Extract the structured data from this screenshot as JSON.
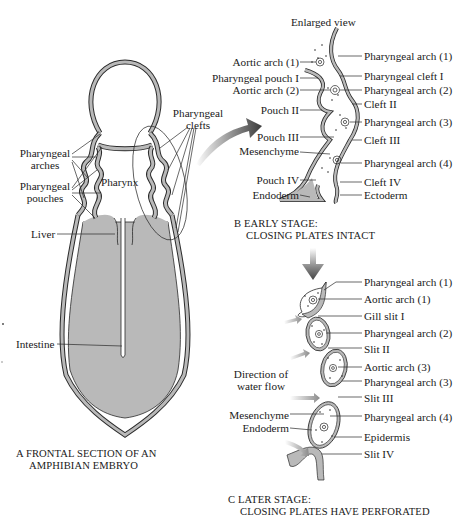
{
  "panel_a": {
    "labels": {
      "pharyngeal_arches": "Pharyngeal\narches",
      "pharyngeal_arches_l1": "Pharyngeal",
      "pharyngeal_arches_l2": "arches",
      "pharyngeal_pouches_l1": "Pharyngeal",
      "pharyngeal_pouches_l2": "pouches",
      "pharyngeal_clefts_l1": "Pharyngeal",
      "pharyngeal_clefts_l2": "clefts",
      "pharynx": "Pharynx",
      "liver": "Liver",
      "intestine": "Intestine"
    },
    "caption_l1": "A  FRONTAL SECTION OF AN",
    "caption_l2": "AMPHIBIAN EMBRYO"
  },
  "panel_b": {
    "title": "Enlarged view",
    "left_labels": [
      "Aortic arch (1)",
      "Pharyngeal pouch I",
      "Aortic arch (2)",
      "Pouch II",
      "Pouch III",
      "Mesenchyme",
      "Pouch IV",
      "Endoderm"
    ],
    "right_labels": [
      "Pharyngeal arch (1)",
      "Pharyngeal cleft I",
      "Pharyngeal arch (2)",
      "Cleft II",
      "Pharyngeal arch (3)",
      "Cleft III",
      "Pharyngeal arch (4)",
      "Cleft IV",
      "Ectoderm"
    ],
    "caption_l1": "B  EARLY STAGE:",
    "caption_l2": "CLOSING PLATES INTACT"
  },
  "panel_c": {
    "left_labels": [
      "Direction of",
      "water flow",
      "Mesenchyme",
      "Endoderm"
    ],
    "right_labels": [
      "Pharyngeal arch (1)",
      "Aortic arch (1)",
      "Gill slit I",
      "Pharyngeal arch (2)",
      "Slit II",
      "Aortic arch (3)",
      "Pharyngeal arch (3)",
      "Slit III",
      "Pharyngeal arch (4)",
      "Epidermis",
      "Slit IV"
    ],
    "caption_l1": "C  LATER STAGE:",
    "caption_l2": "CLOSING PLATES HAVE PERFORATED"
  },
  "colors": {
    "tissue_gray": "#b9b9b9",
    "outline": "#2a2a2a",
    "arrow_dark": "#444444",
    "arrow_light": "#9a9a9a"
  }
}
